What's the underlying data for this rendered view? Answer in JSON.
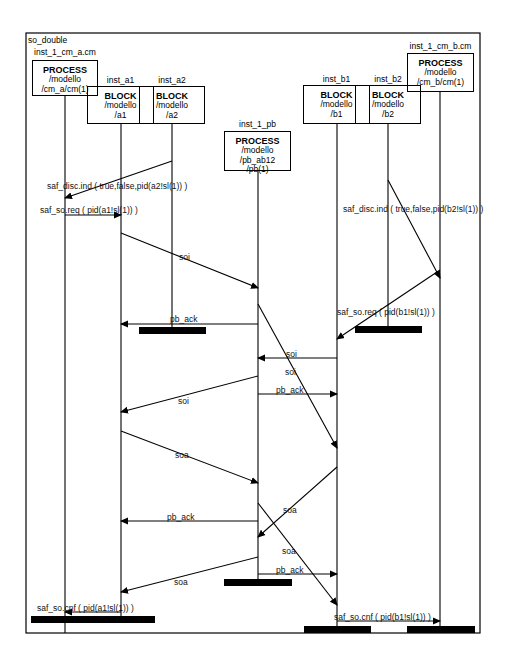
{
  "diagram": {
    "title": "so_double",
    "type": "message-sequence-chart",
    "frame": {
      "x1": 26,
      "y1": 33,
      "x2": 480,
      "y2": 633
    },
    "instances": [
      {
        "id": "cm_a",
        "name": "inst_1_cm_a.cm",
        "kind": "PROCESS",
        "line1": "/modello",
        "line2": "/cm_a/cm(1)",
        "line3": "",
        "x": 65,
        "box": {
          "x": 32,
          "y": 60,
          "w": 66,
          "h": 36
        },
        "label_y": 48,
        "end_y": 633
      },
      {
        "id": "a1",
        "name": "inst_a1",
        "kind": "BLOCK",
        "line1": "/modello",
        "line2": "/a1",
        "line3": "",
        "x": 121,
        "box": {
          "x": 87,
          "y": 86,
          "w": 67,
          "h": 38
        },
        "label_y": 76,
        "end_y": 617
      },
      {
        "id": "a2",
        "name": "inst_a2",
        "kind": "BLOCK",
        "line1": "/modello",
        "line2": "/a2",
        "line3": "",
        "x": 172,
        "box": {
          "x": 139,
          "y": 86,
          "w": 66,
          "h": 38
        },
        "label_y": 76,
        "end_y": 330
      },
      {
        "id": "pb",
        "name": "inst_1_pb",
        "kind": "PROCESS",
        "line1": "/modello",
        "line2": "/pb_ab12",
        "line3": "/pb(1)",
        "x": 258,
        "box": {
          "x": 224,
          "y": 131,
          "w": 67,
          "h": 40
        },
        "label_y": 120,
        "end_y": 582
      },
      {
        "id": "b1",
        "name": "inst_b1",
        "kind": "BLOCK",
        "line1": "/modello",
        "line2": "/b1",
        "line3": "",
        "x": 337,
        "box": {
          "x": 303,
          "y": 85,
          "w": 67,
          "h": 39
        },
        "label_y": 75,
        "end_y": 629
      },
      {
        "id": "b2",
        "name": "inst_b2",
        "kind": "BLOCK",
        "line1": "/modello",
        "line2": "/b2",
        "line3": "",
        "x": 388,
        "box": {
          "x": 355,
          "y": 85,
          "w": 66,
          "h": 39
        },
        "label_y": 75,
        "end_y": 330
      },
      {
        "id": "cm_b",
        "name": "inst_1_cm_b.cm",
        "kind": "PROCESS",
        "line1": "/modello",
        "line2": "/cm_b/cm(1)",
        "line3": "",
        "x": 440,
        "box": {
          "x": 407,
          "y": 53,
          "w": 67,
          "h": 39
        },
        "label_y": 42,
        "end_y": 629
      }
    ],
    "messages": [
      {
        "label": "saf_disc.ind ( true,false,pid(a2!sl(1)) )",
        "from": "a2",
        "to": "cm_a",
        "x1": 172,
        "y1": 161,
        "x2": 65,
        "y2": 198,
        "lx": 47,
        "ly": 182
      },
      {
        "label": "saf_so.req ( pid(a1!sl(1)) )",
        "from": "cm_a",
        "to": "a1",
        "x1": 65,
        "y1": 215,
        "x2": 121,
        "y2": 215,
        "lx": 40,
        "ly": 206
      },
      {
        "label": "soi",
        "from": "a1",
        "to": "pb",
        "x1": 121,
        "y1": 233,
        "x2": 258,
        "y2": 288,
        "lx": 179,
        "ly": 253
      },
      {
        "label": "saf_disc.ind ( true,false,pid(b2!sl(1)) )",
        "from": "b2",
        "to": "cm_b",
        "x1": 388,
        "y1": 180,
        "x2": 440,
        "y2": 278,
        "lx": 343,
        "ly": 205
      },
      {
        "label": "pb_ack",
        "from": "pb",
        "to": "a1",
        "x1": 258,
        "y1": 324,
        "x2": 121,
        "y2": 324,
        "lx": 170,
        "ly": 315
      },
      {
        "label": "saf_so.req ( pid(b1!sl(1)) )",
        "from": "cm_b",
        "to": "b1",
        "x1": 440,
        "y1": 270,
        "x2": 337,
        "y2": 339,
        "lx": 337,
        "ly": 308
      },
      {
        "label": "soi",
        "from": "b1",
        "to": "pb",
        "x1": 337,
        "y1": 358,
        "x2": 258,
        "y2": 358,
        "lx": 286,
        "ly": 350
      },
      {
        "label": "soi",
        "from": "pb",
        "to": "b1",
        "x1": 258,
        "y1": 304,
        "x2": 337,
        "y2": 448,
        "lx": 285,
        "ly": 368
      },
      {
        "label": "soi",
        "from": "pb",
        "to": "a1",
        "x1": 258,
        "y1": 376,
        "x2": 121,
        "y2": 412,
        "lx": 178,
        "ly": 397
      },
      {
        "label": "pb_ack",
        "from": "pb",
        "to": "b1",
        "x1": 258,
        "y1": 394,
        "x2": 337,
        "y2": 394,
        "lx": 276,
        "ly": 386
      },
      {
        "label": "soa",
        "from": "a1",
        "to": "pb",
        "x1": 121,
        "y1": 431,
        "x2": 258,
        "y2": 483,
        "lx": 175,
        "ly": 451
      },
      {
        "label": "pb_ack",
        "from": "pb",
        "to": "a1",
        "x1": 258,
        "y1": 521,
        "x2": 121,
        "y2": 521,
        "lx": 167,
        "ly": 513
      },
      {
        "label": "soa",
        "from": "b1",
        "to": "pb",
        "x1": 337,
        "y1": 467,
        "x2": 258,
        "y2": 537,
        "lx": 283,
        "ly": 506
      },
      {
        "label": "soa",
        "from": "pb",
        "to": "b1",
        "x1": 258,
        "y1": 503,
        "x2": 337,
        "y2": 605,
        "lx": 282,
        "ly": 547
      },
      {
        "label": "soa",
        "from": "pb",
        "to": "a1",
        "x1": 258,
        "y1": 557,
        "x2": 121,
        "y2": 592,
        "lx": 174,
        "ly": 578
      },
      {
        "label": "pb_ack",
        "from": "pb",
        "to": "b1",
        "x1": 258,
        "y1": 574,
        "x2": 337,
        "y2": 574,
        "lx": 276,
        "ly": 566
      },
      {
        "label": "saf_so.cnf ( pid(a1!sl(1)) )",
        "from": "a1",
        "to": "cm_a",
        "x1": 121,
        "y1": 612,
        "x2": 65,
        "y2": 612,
        "lx": 37,
        "ly": 604
      },
      {
        "label": "saf_so.cnf ( pid(b1!sl(1)) )",
        "from": "b1",
        "to": "cm_b",
        "x1": 337,
        "y1": 621,
        "x2": 440,
        "y2": 621,
        "lx": 334,
        "ly": 613
      }
    ],
    "stops": [
      {
        "instance": "a2",
        "x": 139,
        "y": 327,
        "w": 67
      },
      {
        "instance": "b2",
        "x": 355,
        "y": 326,
        "w": 67
      },
      {
        "instance": "pb",
        "x": 224,
        "y": 579,
        "w": 68
      },
      {
        "instance": "cm_a",
        "x": 31,
        "y": 616,
        "w": 124
      },
      {
        "instance": "b1",
        "x": 304,
        "y": 626,
        "w": 67
      },
      {
        "instance": "cm_b",
        "x": 407,
        "y": 626,
        "w": 68
      }
    ]
  }
}
